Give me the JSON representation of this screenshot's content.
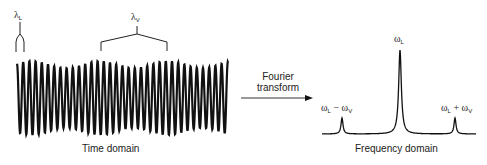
{
  "diagram": {
    "time_domain": {
      "caption": "Time domain",
      "lambda_L": {
        "symbol": "λ",
        "subscript": "L"
      },
      "lambda_V": {
        "symbol": "λ",
        "subscript": "V"
      },
      "waveform": {
        "x_start": 17,
        "x_end": 228,
        "center_y": 98,
        "amplitude_max": 37,
        "amplitude_min": 30,
        "carrier_period_px": 6.2,
        "envelope_period_px": 68
      }
    },
    "transform": {
      "line1": "Fourier",
      "line2": "transform"
    },
    "frequency_domain": {
      "caption": "Frequency domain",
      "peaks": [
        {
          "label_main": "ω",
          "label_sub": "L",
          "label_op": "−",
          "label_main2": "ω",
          "label_sub2": "V",
          "x": 342,
          "height": 16
        },
        {
          "label_main": "ω",
          "label_sub": "L",
          "x": 400,
          "height": 84
        },
        {
          "label_main": "ω",
          "label_sub": "L",
          "label_op": "+",
          "label_main2": "ω",
          "label_sub2": "V",
          "x": 455,
          "height": 16
        }
      ],
      "baseline_y": 134,
      "baseline_x_start": 322,
      "baseline_x_end": 476
    },
    "colors": {
      "ink": "#111111",
      "background": "#ffffff"
    }
  }
}
